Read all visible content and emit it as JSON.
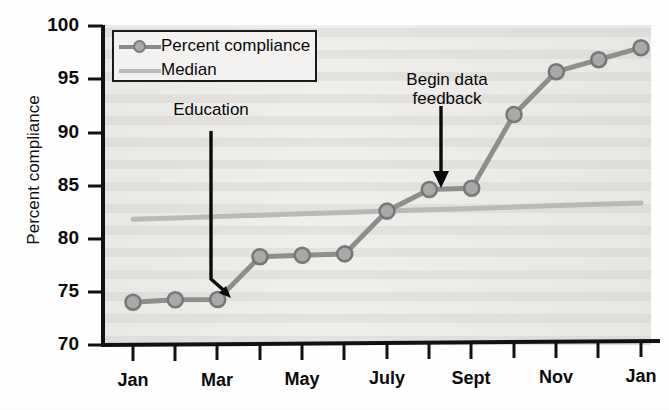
{
  "chart_data": {
    "type": "line",
    "title": "",
    "xlabel": "",
    "ylabel": "Percent compliance",
    "ylim": [
      70,
      100
    ],
    "ytick_values": [
      70,
      75,
      80,
      85,
      90,
      95,
      100
    ],
    "ytick_labels": [
      "70",
      "75",
      "80",
      "85",
      "90",
      "95",
      "100"
    ],
    "grid": false,
    "legend_position": "top-left",
    "x": [
      "Jan",
      "Feb",
      "Mar",
      "Apr",
      "May",
      "June",
      "July",
      "Aug",
      "Sept",
      "Oct",
      "Nov",
      "Dec",
      "Jan"
    ],
    "xtick_labels": [
      "Jan",
      "Mar",
      "May",
      "July",
      "Sept",
      "Nov",
      "Jan"
    ],
    "xtick_label_indices": [
      0,
      2,
      4,
      6,
      8,
      10,
      12
    ],
    "series": [
      {
        "name": "Percent compliance",
        "marker": "circle",
        "color": "#8e8e8e",
        "marker_fill": "#a9a9a9",
        "values": [
          74.0,
          74.2,
          74.2,
          78.2,
          78.3,
          78.4,
          82.4,
          84.4,
          84.5,
          91.4,
          95.4,
          96.5,
          97.6
        ]
      },
      {
        "name": "Median",
        "marker": "none",
        "color": "#b9b9b9",
        "values": [
          81.8,
          81.9,
          82.0,
          82.1,
          82.2,
          82.3,
          82.4,
          82.5,
          82.6,
          82.7,
          82.8,
          82.9,
          83.0
        ]
      }
    ],
    "annotations": [
      {
        "id": "education",
        "text": "Education",
        "arrow_style": "bent",
        "points_to_x_index": 3,
        "points_to_value": 76.5
      },
      {
        "id": "feedback",
        "text": "Begin data\nfeedback",
        "arrow_style": "straight-down",
        "points_to_x_index": 8,
        "points_to_value": 85.5
      }
    ]
  },
  "legend": {
    "items": [
      {
        "label": "Percent compliance",
        "key": "line-with-circle-marker"
      },
      {
        "label": "Median",
        "key": "plain-line"
      }
    ]
  },
  "axes": {
    "y_title": "Percent compliance"
  },
  "colors": {
    "plot_background": "#eeedea",
    "axis": "#111111",
    "series_compliance": "#8e8e8e",
    "series_median": "#b9b9b9",
    "annotation": "#060606"
  }
}
